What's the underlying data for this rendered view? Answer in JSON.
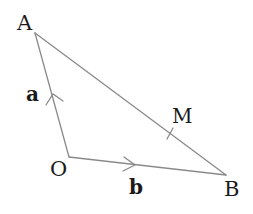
{
  "diagram": {
    "type": "vector-triangle",
    "points": {
      "A": {
        "label": "A",
        "x": 35,
        "y": 33
      },
      "O": {
        "label": "O",
        "x": 69,
        "y": 157
      },
      "B": {
        "label": "B",
        "x": 226,
        "y": 175
      },
      "M": {
        "label": "M",
        "x": 168,
        "y": 133
      }
    },
    "vectors": {
      "a": {
        "label": "a",
        "from": "O",
        "to": "A"
      },
      "b": {
        "label": "b",
        "from": "O",
        "to": "B"
      }
    },
    "segments": [
      {
        "from": "O",
        "to": "A",
        "arrow": true
      },
      {
        "from": "O",
        "to": "B",
        "arrow": true
      },
      {
        "from": "A",
        "to": "B",
        "arrow": false,
        "tick_at": "M"
      }
    ],
    "colors": {
      "line": "#8a8a8a",
      "text": "#1a1a1a",
      "background": "#ffffff"
    }
  }
}
